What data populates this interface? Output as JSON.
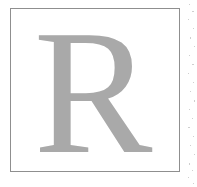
{
  "canvas": {
    "width": 197,
    "height": 187,
    "background_color": "#ffffff"
  },
  "plate": {
    "name": "letter-plate",
    "border_color": "#8f8f8f",
    "fill_color": "#ffffff",
    "border_width_px": 1,
    "left": 10,
    "top": 8,
    "width": 170,
    "height": 164
  },
  "glyph": {
    "character": "R",
    "color": "#a9a9a9",
    "typeface_style": "serif",
    "font_size_px": 178,
    "description": "capital letter R"
  },
  "margin": {
    "speckle_color": "#cfcfcf",
    "speckle_count": 22
  }
}
